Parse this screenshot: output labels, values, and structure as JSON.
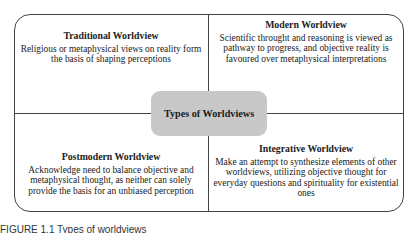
{
  "diagram": {
    "center_label": "Types of Worldviews",
    "quadrants": [
      {
        "position": "top-left",
        "title": "Traditional Worldview",
        "description": "Religious or metaphysical views on reality form the basis of shaping perceptions"
      },
      {
        "position": "top-right",
        "title": "Modern Worldview",
        "description": "Scientific throught and reasoning is viewed as pathway to progress, and objective reality is favoured over metaphysical interpretations"
      },
      {
        "position": "bottom-left",
        "title": "Postmodern Worldview",
        "description": "Acknowledge need to balance objective and metaphysical thought, as neither can solely provide the basis for an unbiased perception"
      },
      {
        "position": "bottom-right",
        "title": "Integrative Worldview",
        "description": "Make an attempt to synthesize elements of other worldviews, utilizing objective thought for everyday questions and spirituality for existential ones"
      }
    ],
    "caption": "FIGURE 1.1   Types of worldviews"
  },
  "colors": {
    "center_fill": "#c8c8c8",
    "line": "#444444"
  }
}
